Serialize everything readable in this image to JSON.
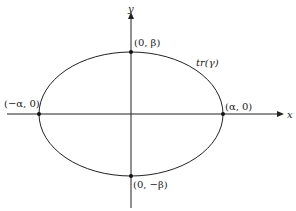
{
  "diagram": {
    "type": "ellipse-on-axes",
    "colors": {
      "stroke": "#222222",
      "background": "#ffffff"
    },
    "axes": {
      "x_label": "x",
      "y_label": "y"
    },
    "curve_label": "tr(γ)",
    "points": [
      {
        "id": "top",
        "label": "(0, β)"
      },
      {
        "id": "bottom",
        "label": "(0, −β)"
      },
      {
        "id": "left",
        "label": "(−α, 0)"
      },
      {
        "id": "right",
        "label": "(α, 0)"
      }
    ]
  }
}
